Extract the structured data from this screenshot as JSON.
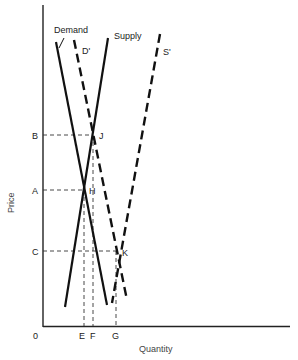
{
  "diagram": {
    "type": "supply-demand",
    "axes": {
      "x_label": "Quantity",
      "y_label": "Price",
      "origin_label": "0"
    },
    "price_levels": [
      {
        "label": "B",
        "point": "J"
      },
      {
        "label": "A",
        "point": "H"
      },
      {
        "label": "C",
        "point": "K"
      }
    ],
    "quantity_levels": [
      {
        "label": "E",
        "point": "H"
      },
      {
        "label": "F",
        "point": "J"
      },
      {
        "label": "G",
        "point": "K"
      }
    ],
    "curves": [
      {
        "label": "Demand",
        "style": "solid"
      },
      {
        "label": "D'",
        "style": "dashed"
      },
      {
        "label": "Supply",
        "style": "solid"
      },
      {
        "label": "S'",
        "style": "dashed"
      }
    ],
    "points": [
      {
        "label": "J"
      },
      {
        "label": "H"
      },
      {
        "label": "K"
      }
    ]
  }
}
